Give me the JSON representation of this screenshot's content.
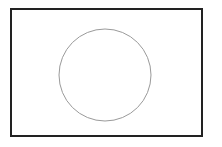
{
  "diagram": {
    "canvas": {
      "width": 222,
      "height": 147,
      "background": "#ffffff"
    },
    "shapes": [
      {
        "id": "outer-rectangle",
        "type": "rect",
        "x": 11,
        "y": 9,
        "width": 191,
        "height": 127,
        "fill": "#ffffff",
        "stroke": "#222222",
        "stroke_width": 2
      },
      {
        "id": "inner-circle",
        "type": "circle",
        "cx": 105,
        "cy": 75,
        "r": 46,
        "fill": "none",
        "stroke": "#9a9a9a",
        "stroke_width": 1
      }
    ]
  }
}
